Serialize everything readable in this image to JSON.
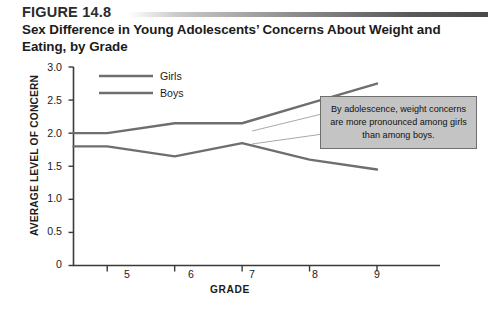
{
  "figure": {
    "number": "FIGURE 14.8",
    "title": "Sex Difference in Young Adolescents’ Concerns About Weight and Eating, by Grade"
  },
  "annotation": {
    "text": "By adolescence, weight concerns are more pronounced among girls than among boys."
  },
  "colors": {
    "girls_line": "#6e6e6e",
    "boys_line": "#6e6e6e",
    "axis": "#3a3a3a",
    "callout_fill": "#c4c4c4",
    "callout_border": "#6f6f6f",
    "text": "#1b1b1b"
  },
  "chart_data": {
    "type": "line",
    "title": "Sex Difference in Young Adolescents’ Concerns About Weight and Eating, by Grade",
    "xlabel": "GRADE",
    "ylabel": "AVERAGE LEVEL OF CONCERN",
    "x": [
      4.5,
      5,
      6,
      7,
      8,
      9
    ],
    "xtick_labels": [
      "5",
      "6",
      "7",
      "8",
      "9"
    ],
    "xticks": [
      5,
      6,
      7,
      8,
      9
    ],
    "ytick_labels": [
      "0",
      "0.5",
      "1.0",
      "1.5",
      "2.0",
      "2.5",
      "3.0"
    ],
    "yticks": [
      0,
      0.5,
      1.0,
      1.5,
      2.0,
      2.5,
      3.0
    ],
    "xlim": [
      4.5,
      9
    ],
    "ylim": [
      0,
      3.0
    ],
    "grid": false,
    "legend_position": "top-left-inside",
    "series": [
      {
        "name": "Girls",
        "values": [
          2.0,
          2.0,
          2.15,
          2.15,
          2.45,
          2.75
        ]
      },
      {
        "name": "Boys",
        "values": [
          1.8,
          1.8,
          1.65,
          1.85,
          1.6,
          1.45
        ]
      }
    ]
  }
}
